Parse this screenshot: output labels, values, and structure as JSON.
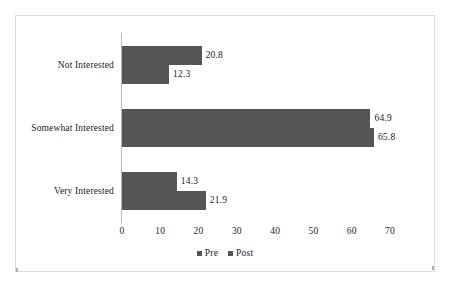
{
  "chart_data": {
    "type": "bar",
    "orientation": "horizontal",
    "title": "",
    "xlabel": "",
    "ylabel": "",
    "categories": [
      "Not Interested",
      "Somewhat Interested",
      "Very Interested"
    ],
    "series": [
      {
        "name": "Pre",
        "values": [
          20.8,
          64.9,
          14.3
        ],
        "color": "#555555"
      },
      {
        "name": "Post",
        "values": [
          12.3,
          65.8,
          21.9
        ],
        "color": "#565656"
      }
    ],
    "value_ticks": [
      0,
      10,
      20,
      30,
      40,
      50,
      60,
      70
    ],
    "xlim": [
      0,
      70
    ],
    "grid": false,
    "legend_position": "bottom",
    "data_labels": [
      {
        "category": "Not Interested",
        "series": "Pre",
        "text": "20.8"
      },
      {
        "category": "Not Interested",
        "series": "Post",
        "text": "12.3"
      },
      {
        "category": "Somewhat Interested",
        "series": "Pre",
        "text": "64.9"
      },
      {
        "category": "Somewhat Interested",
        "series": "Post",
        "text": "65.8"
      },
      {
        "category": "Very Interested",
        "series": "Pre",
        "text": "14.3"
      },
      {
        "category": "Very Interested",
        "series": "Post",
        "text": "21.9"
      }
    ]
  },
  "legend": {
    "items": [
      {
        "label": "Pre"
      },
      {
        "label": "Post"
      }
    ]
  }
}
